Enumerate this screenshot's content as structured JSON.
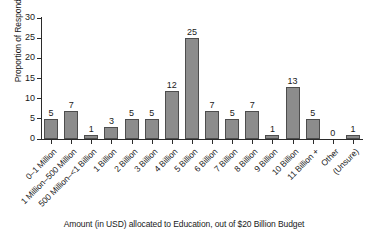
{
  "chart_data": {
    "type": "bar",
    "title": "",
    "xlabel": "Amount (in USD) allocated to Education, out of $20 Billion Budget",
    "ylabel": "Proportion of Respondents",
    "ylim": [
      0,
      30
    ],
    "yticks": [
      0,
      5,
      10,
      15,
      20,
      25,
      30
    ],
    "grid": false,
    "legend": null,
    "bar_color": "#8c8c8c",
    "bar_edge_color": "#4d4d4d",
    "value_labels": true,
    "categories": [
      "0–1 Million",
      "1 Million–500 Million",
      "500 Million–<1 Billion",
      "1 Billion",
      "2 Billion",
      "3 Billion",
      "4 Billion",
      "5 Billion",
      "6 Billion",
      "7 Billion",
      "8 Billion",
      "9 Billion",
      "10 Billion",
      "11 Billion +",
      "Other",
      "(Unsure)"
    ],
    "values": [
      5,
      7,
      1,
      3,
      5,
      5,
      12,
      25,
      7,
      5,
      7,
      1,
      13,
      5,
      0,
      1
    ]
  }
}
